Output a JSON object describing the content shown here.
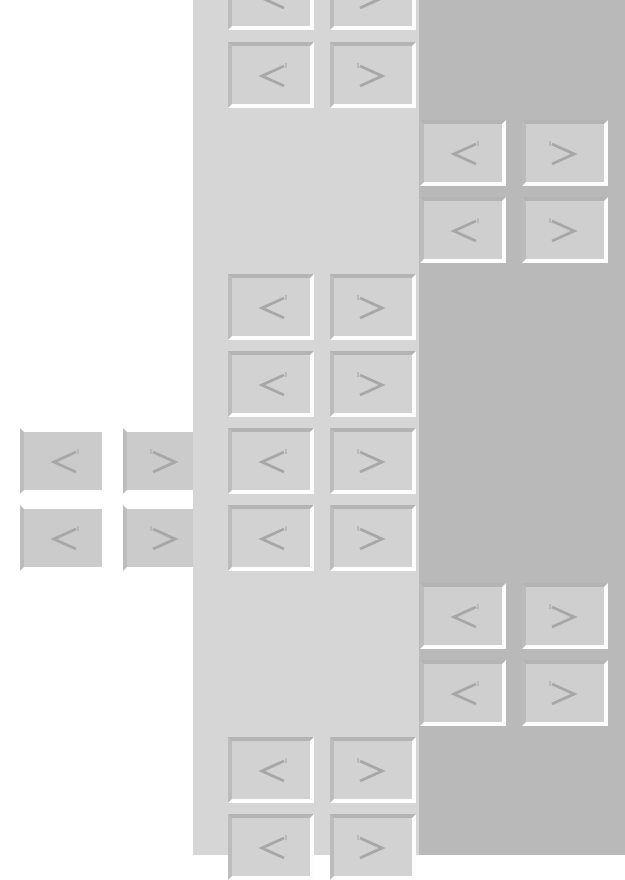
{
  "theme": {
    "column_colors": [
      "#ffffff",
      "#d6d6d6",
      "#b9b9b9"
    ],
    "button_face": "#d2d2d2",
    "glyph_color": "#a7a7a7"
  },
  "buttons": {
    "prev": {
      "label": "<",
      "icon": "chevron-left-icon"
    },
    "next": {
      "label": ">",
      "icon": "chevron-right-icon"
    }
  },
  "clusters": [
    {
      "name": "cluster-a",
      "column": 2,
      "rows": 2
    },
    {
      "name": "cluster-b",
      "column": 3,
      "rows": 2
    },
    {
      "name": "cluster-c",
      "column": 2,
      "rows": 2
    },
    {
      "name": "cluster-d",
      "column": 2,
      "rows": 2
    },
    {
      "name": "cluster-e",
      "column": 1,
      "rows": 2
    },
    {
      "name": "cluster-f",
      "column": 3,
      "rows": 2
    },
    {
      "name": "cluster-g",
      "column": 2,
      "rows": 2
    }
  ]
}
